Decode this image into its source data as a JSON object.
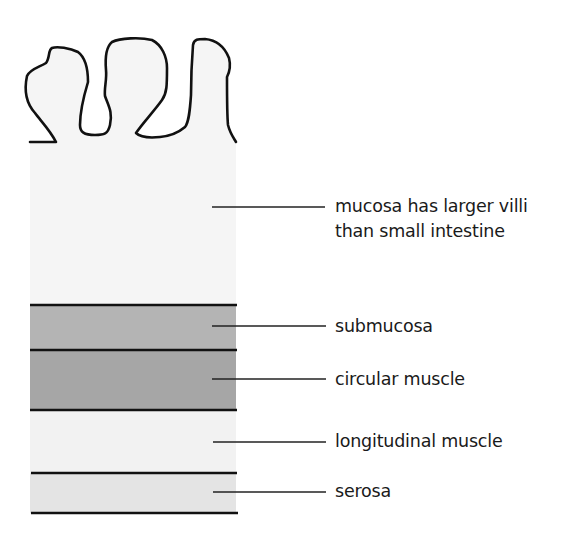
{
  "diagram": {
    "colors": {
      "mucosa": "#f5f5f5",
      "submucosa": "#b4b4b4",
      "circular_muscle": "#a6a6a6",
      "longitudinal_muscle": "#f2f2f2",
      "serosa": "#e4e4e4",
      "outline": "#111111"
    },
    "layers": [
      {
        "id": "mucosa",
        "label_line1": "mucosa has larger villi",
        "label_line2": "than small intestine"
      },
      {
        "id": "submucosa",
        "label": "submucosa"
      },
      {
        "id": "circular_muscle",
        "label": "circular muscle"
      },
      {
        "id": "longitudinal_muscle",
        "label": "longitudinal muscle"
      },
      {
        "id": "serosa",
        "label": "serosa"
      }
    ]
  }
}
